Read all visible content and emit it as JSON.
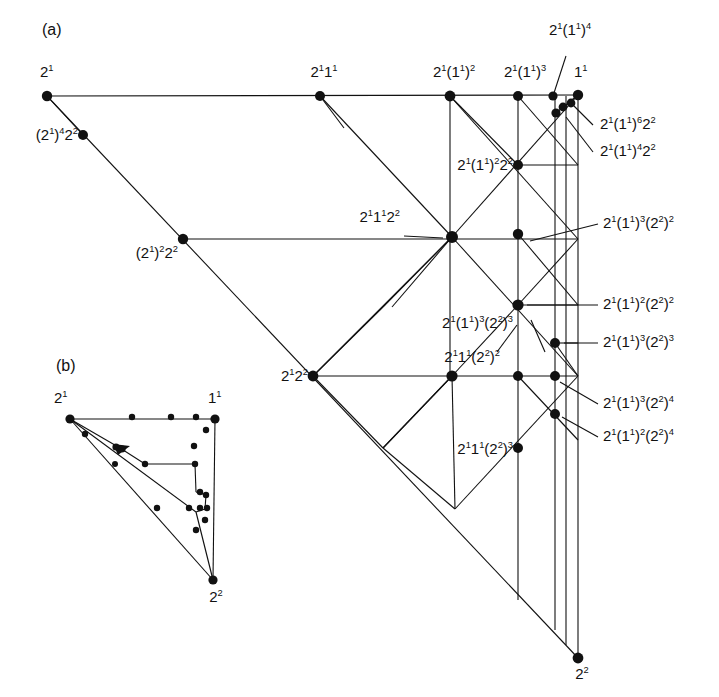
{
  "figure": {
    "panels": [
      {
        "id": "a",
        "tag": "(a)"
      },
      {
        "id": "b",
        "tag": "(b)"
      }
    ],
    "ink_color": "#111111",
    "background": "#ffffff",
    "node_color": "#111111"
  },
  "panel_a": {
    "tag": "(a)",
    "labels": {
      "top_left_vertex": "2<sup>1</sup>",
      "left_upper": "(2<sup>1</sup>)<sup>4</sup>2<sup>2</sup>",
      "left_mid": "(2<sup>1</sup>)<sup>2</sup>2<sup>2</sup>",
      "left_lower": "2<sup>1</sup>2<sup>2</sup>",
      "top_2_1_1_1": "2<sup>1</sup>1<sup>1</sup>",
      "top_2_1_11_2": "2<sup>1</sup>(1<sup>1</sup>)<sup>2</sup>",
      "top_2_1_11_3": "2<sup>1</sup>(1<sup>1</sup>)<sup>3</sup>",
      "top_2_1_11_4": "2<sup>1</sup>(1<sup>1</sup>)<sup>4</sup>",
      "top_right_vertex": "1<sup>1</sup>",
      "r_11_6_22": "2<sup>1</sup>(1<sup>1</sup>)<sup>6</sup>2<sup>2</sup>",
      "r_11_4_22": "2<sup>1</sup>(1<sup>1</sup>)<sup>4</sup>2<sup>2</sup>",
      "c_11_2_22": "2<sup>1</sup>(1<sup>1</sup>)<sup>2</sup>2<sup>2</sup>",
      "c_2_1_1_2_2": "2<sup>1</sup>1<sup>1</sup>2<sup>2</sup>",
      "r_11_3_22_2": "2<sup>1</sup>(1<sup>1</sup>)<sup>3</sup>(2<sup>2</sup>)<sup>2</sup>",
      "r_11_2_22_2": "2<sup>1</sup>(1<sup>1</sup>)<sup>2</sup>(2<sup>2</sup>)<sup>2</sup>",
      "r_11_3_22_3": "2<sup>1</sup>(1<sup>1</sup>)<sup>3</sup>(2<sup>2</sup>)<sup>3</sup>",
      "c_11_3_22_3": "2<sup>1</sup>(1<sup>1</sup>)<sup>3</sup>(2<sup>2</sup>)<sup>3</sup>",
      "c_2_1_1_22_2": "2<sup>1</sup>1<sup>1</sup>(2<sup>2</sup>)<sup>2</sup>",
      "r_11_3_22_4": "2<sup>1</sup>(1<sup>1</sup>)<sup>3</sup>(2<sup>2</sup>)<sup>4</sup>",
      "r_11_2_22_4": "2<sup>1</sup>(1<sup>1</sup>)<sup>2</sup>(2<sup>2</sup>)<sup>4</sup>",
      "c_2_1_1_22_3": "2<sup>1</sup>1<sup>1</sup>(2<sup>2</sup>)<sup>3</sup>",
      "bottom_vertex": "2<sup>2</sup>"
    },
    "nodes": [
      {
        "x": 47,
        "y": 96,
        "r": 5.2,
        "name": "node-2-1"
      },
      {
        "x": 83,
        "y": 135,
        "r": 5.0,
        "name": "node-2-1-4-2-2"
      },
      {
        "x": 183,
        "y": 239,
        "r": 5.2,
        "name": "node-2-1-2-2-2"
      },
      {
        "x": 313,
        "y": 376,
        "r": 5.4,
        "name": "node-2-1-2-2"
      },
      {
        "x": 320,
        "y": 96,
        "r": 5.0,
        "name": "node-2-1-1-1"
      },
      {
        "x": 450,
        "y": 96,
        "r": 5.4,
        "name": "node-2-1-11-2"
      },
      {
        "x": 518,
        "y": 96,
        "r": 5.0,
        "name": "node-2-1-11-3"
      },
      {
        "x": 553,
        "y": 96,
        "r": 4.6,
        "name": "node-2-1-11-4"
      },
      {
        "x": 578,
        "y": 95,
        "r": 5.2,
        "name": "node-1-1"
      },
      {
        "x": 571,
        "y": 103,
        "r": 4.4,
        "name": "node-2-1-11-6-2-2"
      },
      {
        "x": 563,
        "y": 107,
        "r": 4.4,
        "name": "node-chain-c"
      },
      {
        "x": 556,
        "y": 113,
        "r": 4.6,
        "name": "node-2-1-11-4-2-2"
      },
      {
        "x": 518,
        "y": 165,
        "r": 5.0,
        "name": "node-2-1-11-2-2-2"
      },
      {
        "x": 452,
        "y": 237,
        "r": 6.0,
        "name": "node-2-1-1-1-2-2"
      },
      {
        "x": 518,
        "y": 234,
        "r": 5.2,
        "name": "node-2-1-11-3-2-2-2"
      },
      {
        "x": 518,
        "y": 305,
        "r": 5.6,
        "name": "node-2-1-11-2-2-2-2"
      },
      {
        "x": 555,
        "y": 343,
        "r": 5.0,
        "name": "node-2-1-11-3-2-2-3"
      },
      {
        "x": 452,
        "y": 376,
        "r": 5.6,
        "name": "node-2-1-1-1-2-2-2"
      },
      {
        "x": 518,
        "y": 376,
        "r": 5.0,
        "name": "node-row-c"
      },
      {
        "x": 555,
        "y": 376,
        "r": 5.0,
        "name": "node-2-1-11-3-2-2-4"
      },
      {
        "x": 555,
        "y": 414,
        "r": 5.0,
        "name": "node-2-1-11-2-2-2-4"
      },
      {
        "x": 518,
        "y": 448,
        "r": 5.0,
        "name": "node-2-1-1-1-2-2-3"
      },
      {
        "x": 578,
        "y": 658,
        "r": 5.4,
        "name": "node-2-2-bottom"
      }
    ]
  },
  "panel_b": {
    "tag": "(b)",
    "labels": {
      "left_vertex": "2<sup>1</sup>",
      "right_vertex": "1<sup>1</sup>",
      "bottom_vertex": "2<sup>2</sup>"
    },
    "nodes": [
      {
        "x": 70,
        "y": 419,
        "r": 4.6,
        "name": "node-b-2-1"
      },
      {
        "x": 215,
        "y": 419,
        "r": 4.6,
        "name": "node-b-1-1"
      },
      {
        "x": 213,
        "y": 580,
        "r": 4.6,
        "name": "node-b-2-2"
      },
      {
        "x": 132,
        "y": 417,
        "r": 3.2,
        "name": "node-b-top-1"
      },
      {
        "x": 171,
        "y": 417,
        "r": 3.2,
        "name": "node-b-top-2"
      },
      {
        "x": 196,
        "y": 417,
        "r": 3.2,
        "name": "node-b-top-3"
      },
      {
        "x": 206,
        "y": 430,
        "r": 3.2,
        "name": "node-b-r-1"
      },
      {
        "x": 194,
        "y": 446,
        "r": 3.2,
        "name": "node-b-r-2"
      },
      {
        "x": 85,
        "y": 434,
        "r": 3.2,
        "name": "node-b-l-1"
      },
      {
        "x": 116,
        "y": 447,
        "r": 3.6,
        "name": "node-b-tri-1"
      },
      {
        "x": 122,
        "y": 449,
        "r": 3.6,
        "name": "node-b-tri-2"
      },
      {
        "x": 145,
        "y": 464,
        "r": 3.2,
        "name": "node-b-mid-1"
      },
      {
        "x": 195,
        "y": 464,
        "r": 3.2,
        "name": "node-b-mid-2"
      },
      {
        "x": 115,
        "y": 464,
        "r": 3.0,
        "name": "node-b-l-2"
      },
      {
        "x": 200,
        "y": 492,
        "r": 3.2,
        "name": "node-b-r-3"
      },
      {
        "x": 206,
        "y": 495,
        "r": 3.2,
        "name": "node-b-r-4"
      },
      {
        "x": 157,
        "y": 508,
        "r": 3.2,
        "name": "node-b-b-1"
      },
      {
        "x": 189,
        "y": 508,
        "r": 3.2,
        "name": "node-b-b-2"
      },
      {
        "x": 200,
        "y": 508,
        "r": 3.2,
        "name": "node-b-b-3"
      },
      {
        "x": 207,
        "y": 508,
        "r": 3.2,
        "name": "node-b-b-4"
      },
      {
        "x": 205,
        "y": 520,
        "r": 3.2,
        "name": "node-b-b-5"
      },
      {
        "x": 196,
        "y": 530,
        "r": 3.2,
        "name": "node-b-b-6"
      }
    ]
  }
}
